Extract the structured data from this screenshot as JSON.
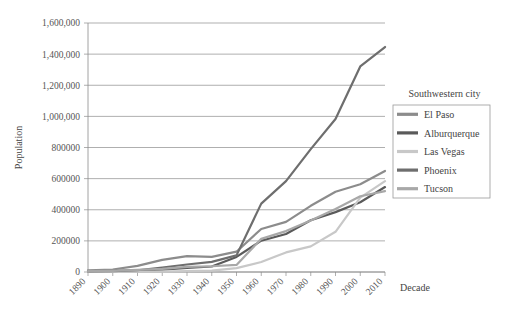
{
  "chart_data": {
    "type": "line",
    "title": "",
    "xlabel": "Decade",
    "ylabel": "Population",
    "categories": [
      "1890",
      "1900",
      "1910",
      "1920",
      "1930",
      "1940",
      "1950",
      "1960",
      "1970",
      "1980",
      "1990",
      "2000",
      "2010"
    ],
    "ylim": [
      0,
      1600000
    ],
    "ytick_labels": [
      "0",
      "200000",
      "400000",
      "600000",
      "800000",
      "1,000,000",
      "1,200,000",
      "1,400,000",
      "1,600,000"
    ],
    "ytick_values": [
      0,
      200000,
      400000,
      600000,
      800000,
      1000000,
      1200000,
      1400000,
      1600000
    ],
    "grid": true,
    "legend_position": "right",
    "legend_title": "Southwestern city",
    "series": [
      {
        "name": "El Paso",
        "color": "#8c8c8c",
        "values": [
          10300,
          15900,
          39300,
          77600,
          102400,
          96800,
          130500,
          276700,
          322300,
          425300,
          515300,
          563700,
          649100
        ]
      },
      {
        "name": "Alburquerque",
        "color": "#5a5a5a",
        "values": [
          3800,
          6200,
          11000,
          15200,
          26500,
          35400,
          96800,
          201200,
          244500,
          332900,
          384700,
          448600,
          545800
        ]
      },
      {
        "name": "Las Vegas",
        "color": "#c8c8c8",
        "values": [
          900,
          1000,
          1500,
          2300,
          5200,
          8400,
          24600,
          64400,
          125800,
          164700,
          258300,
          478400,
          583800
        ]
      },
      {
        "name": "Phoenix",
        "color": "#6e6e6e",
        "values": [
          3200,
          5500,
          11100,
          29100,
          48100,
          65400,
          106800,
          439200,
          584300,
          789700,
          983400,
          1321000,
          1445600
        ]
      },
      {
        "name": "Tucson",
        "color": "#a8a8a8",
        "values": [
          5100,
          7500,
          13200,
          20300,
          32500,
          36800,
          45500,
          212900,
          262900,
          330500,
          405400,
          486700,
          520100
        ]
      }
    ]
  },
  "axes": {
    "y_title": "Population",
    "x_title": "Decade"
  }
}
